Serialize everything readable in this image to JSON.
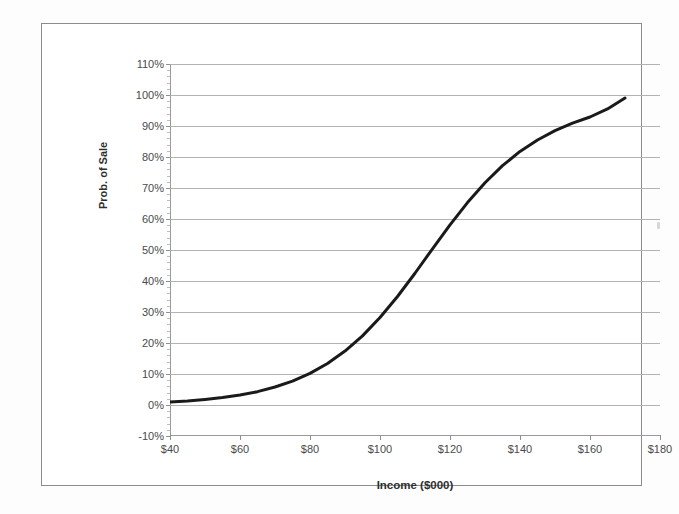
{
  "chart_data": {
    "type": "line",
    "title": "",
    "xlabel": "Income ($000)",
    "ylabel": "Prob. of Sale",
    "xlim": [
      40,
      180
    ],
    "ylim": [
      -10,
      110
    ],
    "xticks": [
      "$40",
      "$60",
      "$80",
      "$100",
      "$120",
      "$140",
      "$160",
      "$180"
    ],
    "xtick_values": [
      40,
      60,
      80,
      100,
      120,
      140,
      160,
      180
    ],
    "yticks": [
      "-10%",
      "0%",
      "10%",
      "20%",
      "30%",
      "40%",
      "50%",
      "60%",
      "70%",
      "80%",
      "90%",
      "100%",
      "110%"
    ],
    "ytick_values": [
      -10,
      0,
      10,
      20,
      30,
      40,
      50,
      60,
      70,
      80,
      90,
      100,
      110
    ],
    "grid": "horizontal",
    "legend": "none",
    "series": [
      {
        "name": "Probability of Sale",
        "color": "#1a1a1a",
        "line_width": 3,
        "x": [
          40,
          45,
          50,
          55,
          60,
          65,
          70,
          75,
          80,
          85,
          90,
          95,
          100,
          105,
          110,
          115,
          120,
          125,
          130,
          135,
          140,
          145,
          150,
          155,
          160,
          165,
          170
        ],
        "y": [
          1.0,
          1.3,
          1.8,
          2.4,
          3.2,
          4.3,
          5.8,
          7.7,
          10.2,
          13.4,
          17.4,
          22.3,
          28.2,
          35.0,
          42.5,
          50.4,
          58.1,
          65.3,
          71.7,
          77.2,
          81.8,
          85.5,
          88.5,
          90.9,
          92.9,
          95.5,
          99.0
        ]
      }
    ]
  },
  "axis": {
    "y_title": "Prob. of Sale",
    "x_title": "Income ($000)"
  },
  "colors": {
    "curve": "#1a1a1a",
    "gridline": "#b2b2b2",
    "axis": "#9a9a9a",
    "frame": "#8c8c8c",
    "plot_background": "#ffffff",
    "page_background": "#fdfdfd",
    "tick_text": "#4a4a4a",
    "title_text": "#2e2e2e"
  }
}
